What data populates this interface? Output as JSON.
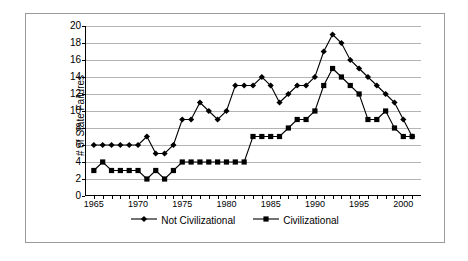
{
  "chart_data": {
    "type": "line",
    "title": "",
    "xlabel": "",
    "ylabel": "# of State Failures",
    "xlim": [
      1964,
      2002
    ],
    "ylim": [
      0,
      20
    ],
    "ytick_step": 2,
    "yticks": [
      0,
      2,
      4,
      6,
      8,
      10,
      12,
      14,
      16,
      18,
      20
    ],
    "xticks": [
      1965,
      1970,
      1975,
      1980,
      1985,
      1990,
      1995,
      2000
    ],
    "xtick_labels": [
      "1965",
      "1970",
      "1975",
      "1980",
      "1985",
      "1990",
      "1995",
      "2000"
    ],
    "ytick_labels": [
      "0",
      "2",
      "4",
      "6",
      "8",
      "10",
      "12",
      "14",
      "16",
      "18",
      "20"
    ],
    "grid": "horizontal",
    "legend_position": "bottom",
    "x": [
      1965,
      1966,
      1967,
      1968,
      1969,
      1970,
      1971,
      1972,
      1973,
      1974,
      1975,
      1976,
      1977,
      1978,
      1979,
      1980,
      1981,
      1982,
      1983,
      1984,
      1985,
      1986,
      1987,
      1988,
      1989,
      1990,
      1991,
      1992,
      1993,
      1994,
      1995,
      1996,
      1997,
      1998,
      1999,
      2000,
      2001
    ],
    "series": [
      {
        "name": "Not Civilizational",
        "marker": "diamond",
        "color": "#000000",
        "values": [
          6,
          6,
          6,
          6,
          6,
          6,
          7,
          5,
          5,
          6,
          9,
          9,
          11,
          10,
          9,
          10,
          13,
          13,
          13,
          14,
          13,
          11,
          12,
          13,
          13,
          14,
          17,
          19,
          18,
          16,
          15,
          14,
          13,
          12,
          11,
          9,
          7
        ]
      },
      {
        "name": "Civilizational",
        "marker": "square",
        "color": "#000000",
        "values": [
          3,
          4,
          3,
          3,
          3,
          3,
          2,
          3,
          2,
          3,
          4,
          4,
          4,
          4,
          4,
          4,
          4,
          4,
          7,
          7,
          7,
          7,
          8,
          9,
          9,
          10,
          13,
          15,
          14,
          13,
          12,
          9,
          9,
          10,
          8,
          7,
          7
        ]
      }
    ]
  },
  "legend": {
    "items": [
      {
        "label": "Not Civilizational",
        "marker": "diamond"
      },
      {
        "label": "Civilizational",
        "marker": "square"
      }
    ]
  }
}
